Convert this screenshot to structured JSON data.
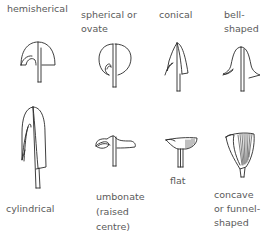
{
  "shapes": [
    {
      "id": "hemisherical",
      "label_lines": [
        "hemisherical"
      ]
    },
    {
      "id": "spherical",
      "label_lines": [
        "spherical or",
        "ovate"
      ]
    },
    {
      "id": "conical",
      "label_lines": [
        "conical"
      ]
    },
    {
      "id": "bell",
      "label_lines": [
        "bell-",
        "shaped"
      ]
    },
    {
      "id": "cylindrical",
      "label_lines": [
        "cylindrical"
      ]
    },
    {
      "id": "umbonate",
      "label_lines": [
        "umbonate",
        "(raised",
        "centre)"
      ]
    },
    {
      "id": "flat",
      "label_lines": [
        "flat"
      ]
    },
    {
      "id": "concave",
      "label_lines": [
        "concave",
        "or funnel-",
        "shaped"
      ]
    }
  ]
}
